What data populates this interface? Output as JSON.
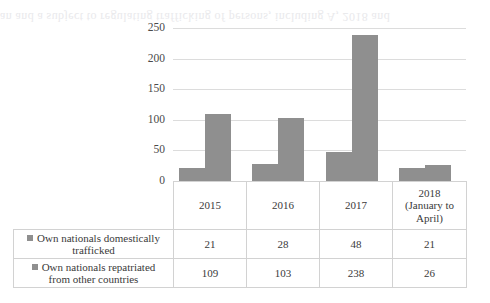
{
  "scan_artifact": {
    "ghost_text": "an and a subject to regulating trafficking of persons, including A, 2018 and"
  },
  "chart_data": {
    "type": "bar",
    "title": "",
    "xlabel": "",
    "ylabel": "",
    "ylim": [
      0,
      250
    ],
    "yticks": [
      0,
      50,
      100,
      150,
      200,
      250
    ],
    "grid": true,
    "legend_position": "table-left-column",
    "categories": [
      "2015",
      "2016",
      "2017",
      "2018 (January to April)"
    ],
    "series": [
      {
        "name": "Own nationals domestically trafficked",
        "values": [
          21,
          28,
          48,
          21
        ],
        "color": "#8f8f8f"
      },
      {
        "name": "Own nationals repatriated from other countries",
        "values": [
          109,
          103,
          238,
          26
        ],
        "color": "#8f8f8f"
      }
    ]
  },
  "axis": {
    "tick_labels": [
      "250",
      "200",
      "150",
      "100",
      "50",
      "0"
    ]
  },
  "table": {
    "year_headers": [
      {
        "line1": "2015",
        "line2": "",
        "line3": ""
      },
      {
        "line1": "2016",
        "line2": "",
        "line3": ""
      },
      {
        "line1": "2017",
        "line2": "",
        "line3": ""
      },
      {
        "line1": "2018",
        "line2": "(January to",
        "line3": "April)"
      }
    ],
    "rows": [
      {
        "label_line1": "Own nationals domestically",
        "label_line2": "trafficked",
        "values": [
          "21",
          "28",
          "48",
          "21"
        ]
      },
      {
        "label_line1": "Own nationals repatriated",
        "label_line2": "from other countries",
        "values": [
          "109",
          "103",
          "238",
          "26"
        ]
      }
    ]
  }
}
